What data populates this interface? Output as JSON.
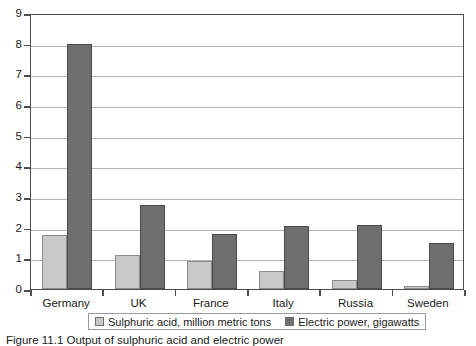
{
  "chart_data": {
    "type": "bar",
    "title": "",
    "xlabel": "",
    "ylabel": "",
    "categories": [
      "Germany",
      "UK",
      "France",
      "Italy",
      "Russia",
      "Sweden"
    ],
    "series": [
      {
        "name": "Sulphuric acid, million metric tons",
        "color": "#c8c8c8",
        "values": [
          1.75,
          1.1,
          0.9,
          0.6,
          0.3,
          0.1
        ]
      },
      {
        "name": "Electric power, gigawatts",
        "color": "#6e6e6e",
        "values": [
          8.0,
          2.75,
          1.8,
          2.05,
          2.1,
          1.5
        ]
      }
    ],
    "ylim": [
      0,
      9
    ],
    "ytick_labels": [
      "0",
      "1",
      "2",
      "3",
      "4",
      "5",
      "6",
      "7",
      "8",
      "9"
    ],
    "ytick_values": [
      0,
      1,
      2,
      3,
      4,
      5,
      6,
      7,
      8,
      9
    ],
    "grid": true,
    "legend_position": "bottom"
  },
  "legend": {
    "entries": [
      {
        "label": "Sulphuric acid, million metric tons",
        "swatch": "s0"
      },
      {
        "label": "Electric power, gigawatts",
        "swatch": "s1"
      }
    ]
  },
  "caption": {
    "text": "Figure 11.1  Output of sulphuric acid and electric power"
  }
}
